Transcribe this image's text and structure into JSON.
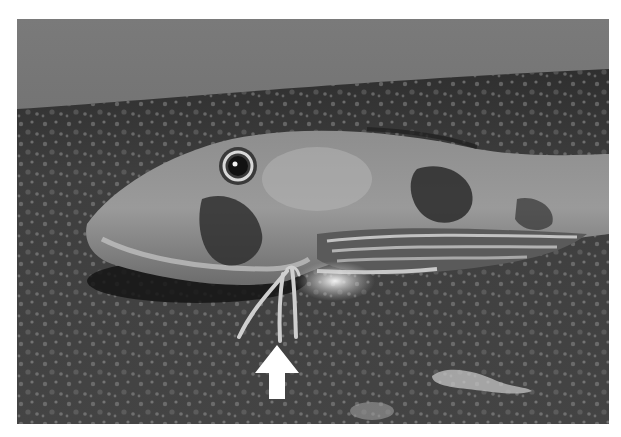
{
  "figure": {
    "annotation": {
      "type": "arrow",
      "direction": "up",
      "color": "#ffffff",
      "points_to": "leg-like pectoral fin rays"
    }
  },
  "colors": {
    "background": "#ffffff",
    "water": "#6e6e6e",
    "seabed": "#3f3f3f",
    "fish_body": "#8a8a8a",
    "fish_dark_patch": "#2e2e2e",
    "highlight": "#e6e6e6",
    "arrow": "#ffffff"
  }
}
